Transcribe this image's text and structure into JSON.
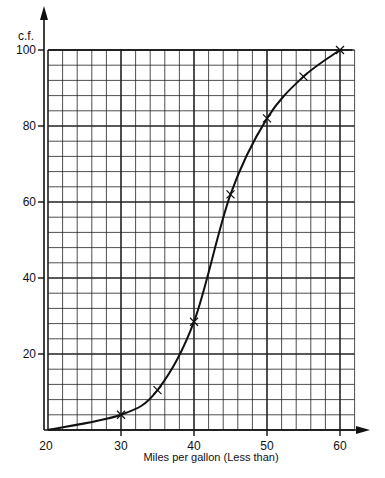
{
  "chart_data": {
    "type": "line",
    "title": "",
    "xlabel": "Miles per gallon (Less than)",
    "ylabel": "c.f.",
    "xlim": [
      20,
      62
    ],
    "ylim": [
      0,
      100
    ],
    "x_ticks": [
      "20",
      "30",
      "40",
      "50",
      "60"
    ],
    "y_ticks": [
      "20",
      "40",
      "60",
      "80",
      "100"
    ],
    "grid": true,
    "grid_minor_x_step": 2,
    "grid_minor_y_step": 4,
    "legend": null,
    "series": [
      {
        "name": "cumulative frequency",
        "marker": "x",
        "x": [
          30,
          35,
          40,
          45,
          50,
          55,
          60
        ],
        "y": [
          4,
          10.5,
          28.5,
          62,
          82,
          93,
          100
        ]
      }
    ],
    "curve_start": [
      20,
      0
    ],
    "colors": {
      "line": "#111111",
      "grid": "#222222",
      "background": "#ffffff"
    }
  }
}
